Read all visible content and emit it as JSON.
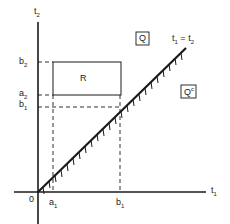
{
  "axes": {
    "x_label": "t",
    "x_sub": "1",
    "y_label": "t",
    "y_sub": "2",
    "origin_label": "0"
  },
  "diagonal": {
    "label_left": "t",
    "label_left_sub": "1",
    "label_eq": " = ",
    "label_right": "t",
    "label_right_sub": "2"
  },
  "ticks": {
    "x": [
      {
        "name": "a",
        "sub": "1"
      },
      {
        "name": "b",
        "sub": "1"
      }
    ],
    "y": [
      {
        "name": "b",
        "sub": "2"
      },
      {
        "name": "a",
        "sub": "2"
      },
      {
        "name": "b",
        "sub": "1"
      }
    ]
  },
  "regions": {
    "rect_label": "R",
    "q_label": "Q",
    "qc_label": "Q",
    "qc_sup": "c"
  },
  "colors": {
    "line": "#1a1a1a",
    "background": "#ffffff"
  }
}
